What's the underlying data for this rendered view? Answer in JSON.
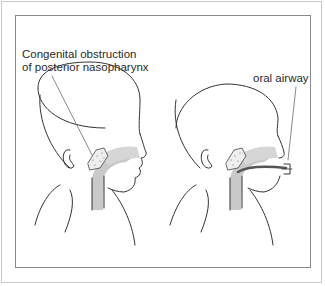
{
  "figure": {
    "labels": {
      "obstruction_line1": "Congenital obstruction",
      "obstruction_line2": "of posterior nasopharynx",
      "oral_airway": "oral airway"
    },
    "panels": [
      {
        "name": "infant-with-obstruction",
        "description": "Infant profile showing congenital obstruction of posterior nasopharynx"
      },
      {
        "name": "infant-with-oral-airway",
        "description": "Infant profile with oral airway inserted"
      }
    ],
    "colors": {
      "line": "#333333",
      "airway_shade": "#c9c9c9",
      "frame": "#8a8a8a",
      "outer_frame": "#c8c8c8"
    }
  }
}
